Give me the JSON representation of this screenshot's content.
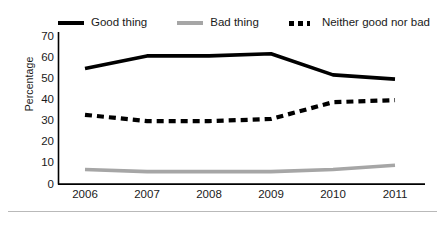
{
  "chart_data": {
    "type": "line",
    "title": "",
    "xlabel": "",
    "ylabel": "Percentage",
    "categories": [
      "2006",
      "2007",
      "2008",
      "2009",
      "2010",
      "2011"
    ],
    "ylim": [
      0,
      70
    ],
    "yticks": [
      70,
      60,
      50,
      40,
      30,
      20,
      10,
      0
    ],
    "grid": false,
    "legend_position": "top",
    "series": [
      {
        "name": "Good thing",
        "style": "solid",
        "color": "#000000",
        "values": [
          55,
          61,
          61,
          62,
          52,
          50
        ]
      },
      {
        "name": "Bad thing",
        "style": "solid",
        "color": "#a6a6a6",
        "values": [
          7,
          6,
          6,
          6,
          7,
          9
        ]
      },
      {
        "name": "Neither good nor bad",
        "style": "dashed",
        "color": "#000000",
        "values": [
          33,
          30,
          30,
          31,
          39,
          40
        ]
      }
    ]
  },
  "axis": {
    "ylabel": "Percentage",
    "yticks": [
      "70",
      "60",
      "50",
      "40",
      "30",
      "20",
      "10",
      "0"
    ],
    "xticks": [
      "2006",
      "2007",
      "2008",
      "2009",
      "2010",
      "2011"
    ]
  },
  "legend": {
    "entries": [
      {
        "label": "Good thing",
        "swatch": "solid-black"
      },
      {
        "label": "Bad thing",
        "swatch": "solid-gray"
      },
      {
        "label": "Neither good nor bad",
        "swatch": "dashed-black"
      }
    ]
  }
}
